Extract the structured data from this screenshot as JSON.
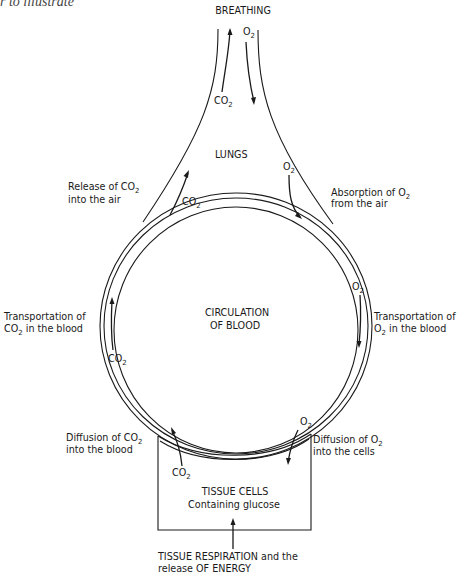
{
  "page_fragment": "r to illustrate",
  "diagram": {
    "title": "BREATHING",
    "lungs_label": "LUNGS",
    "circulation_label": [
      "CIRCULATION",
      "OF BLOOD"
    ],
    "tissue_box": {
      "title": "TISSUE CELLS",
      "subtitle": "Containing glucose"
    },
    "bottom_label": [
      "TISSUE RESPIRATION and the",
      "release OF ENERGY"
    ],
    "side_labels": {
      "release_co2": [
        "Release of CO",
        "into the air"
      ],
      "absorption_o2": [
        "Absorption of O",
        "from the air"
      ],
      "transport_co2": [
        "Transportation of",
        "CO",
        " in the blood"
      ],
      "transport_o2": [
        "Transportation of",
        "O",
        " in the blood"
      ],
      "diffusion_co2": [
        "Diffusion of CO",
        "into the blood"
      ],
      "diffusion_o2": [
        "Diffusion of O",
        "into the cells"
      ]
    },
    "gas_labels": {
      "co2": "CO",
      "o2": "O",
      "subscript": "2"
    }
  }
}
